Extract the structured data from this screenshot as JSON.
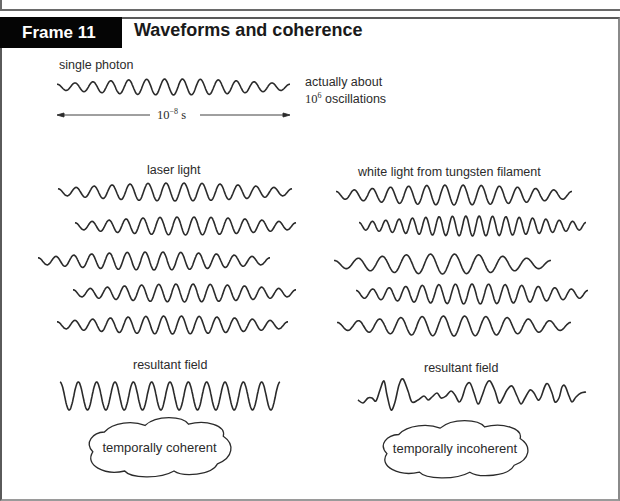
{
  "frame": {
    "badge": "Frame 11",
    "title": "Waveforms and coherence"
  },
  "single_photon": {
    "label": "single photon",
    "note_line1": "actually about",
    "note_line2_base": "10",
    "note_line2_exp": "6",
    "note_line2_rest": " oscillations",
    "duration_base": "10",
    "duration_exp": "−8",
    "duration_unit": " s"
  },
  "laser": {
    "label": "laser light",
    "resultant_label": "resultant field",
    "cloud_label": "temporally coherent"
  },
  "white": {
    "label": "white light from tungsten filament",
    "resultant_label": "resultant field",
    "cloud_label": "temporally incoherent"
  },
  "waves": {
    "single_photon": {
      "x0": 57,
      "x1": 290,
      "y": 87,
      "amp": 8,
      "cycles": 13,
      "envelope": true
    },
    "laser": [
      {
        "x0": 58,
        "x1": 292,
        "y": 192,
        "amp": 9,
        "cycles": 13,
        "envelope": true
      },
      {
        "x0": 75,
        "x1": 296,
        "y": 226,
        "amp": 9,
        "cycles": 13,
        "envelope": true
      },
      {
        "x0": 38,
        "x1": 270,
        "y": 261,
        "amp": 9,
        "cycles": 13,
        "envelope": true
      },
      {
        "x0": 73,
        "x1": 296,
        "y": 293,
        "amp": 9,
        "cycles": 13,
        "envelope": true
      },
      {
        "x0": 57,
        "x1": 288,
        "y": 325,
        "amp": 9,
        "cycles": 13,
        "envelope": true
      }
    ],
    "white": [
      {
        "x0": 336,
        "x1": 572,
        "y": 195,
        "amp": 10,
        "cycles": 13,
        "envelope": true
      },
      {
        "x0": 359,
        "x1": 586,
        "y": 226,
        "amp": 10,
        "cycles": 17,
        "envelope": true
      },
      {
        "x0": 334,
        "x1": 551,
        "y": 264,
        "amp": 10,
        "cycles": 9,
        "envelope": true
      },
      {
        "x0": 356,
        "x1": 588,
        "y": 294,
        "amp": 10,
        "cycles": 14,
        "envelope": true
      },
      {
        "x0": 337,
        "x1": 571,
        "y": 326,
        "amp": 10,
        "cycles": 11,
        "envelope": true
      }
    ],
    "laser_resultant": {
      "x0": 60,
      "x1": 280,
      "y": 396,
      "amp": 14,
      "cycles": 12,
      "envelope": false
    },
    "white_resultant_points": [
      [
        358,
        400
      ],
      [
        363,
        403
      ],
      [
        368,
        398
      ],
      [
        372,
        398
      ],
      [
        376,
        401
      ],
      [
        380,
        390
      ],
      [
        384,
        381
      ],
      [
        387,
        395
      ],
      [
        391,
        410
      ],
      [
        395,
        402
      ],
      [
        399,
        385
      ],
      [
        403,
        379
      ],
      [
        408,
        391
      ],
      [
        412,
        402
      ],
      [
        418,
        400
      ],
      [
        424,
        396
      ],
      [
        428,
        400
      ],
      [
        432,
        397
      ],
      [
        437,
        393
      ],
      [
        441,
        398
      ],
      [
        446,
        396
      ],
      [
        451,
        391
      ],
      [
        455,
        395
      ],
      [
        459,
        402
      ],
      [
        462,
        398
      ],
      [
        466,
        386
      ],
      [
        470,
        383
      ],
      [
        474,
        393
      ],
      [
        478,
        404
      ],
      [
        482,
        396
      ],
      [
        486,
        385
      ],
      [
        490,
        381
      ],
      [
        495,
        391
      ],
      [
        499,
        403
      ],
      [
        503,
        398
      ],
      [
        507,
        390
      ],
      [
        512,
        386
      ],
      [
        517,
        396
      ],
      [
        521,
        404
      ],
      [
        525,
        398
      ],
      [
        530,
        390
      ],
      [
        534,
        393
      ],
      [
        538,
        400
      ],
      [
        541,
        397
      ],
      [
        545,
        386
      ],
      [
        548,
        384
      ],
      [
        552,
        393
      ],
      [
        555,
        402
      ],
      [
        559,
        398
      ],
      [
        562,
        387
      ],
      [
        565,
        386
      ],
      [
        569,
        396
      ],
      [
        572,
        402
      ],
      [
        576,
        397
      ],
      [
        581,
        393
      ],
      [
        586,
        392
      ]
    ]
  },
  "clouds": [
    {
      "x": 87,
      "y": 417,
      "w": 145,
      "h": 60
    },
    {
      "x": 381,
      "y": 420,
      "w": 148,
      "h": 58
    }
  ],
  "colors": {
    "ink": "#2b2b2b",
    "badge_bg": "#050505",
    "badge_text": "#ffffff"
  }
}
